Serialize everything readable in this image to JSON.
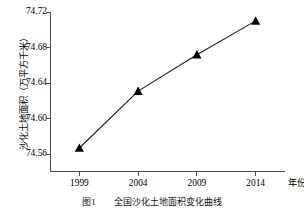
{
  "chart_data": {
    "type": "line",
    "title": "",
    "xlabel": "年份",
    "ylabel": "沙化土地面积（万平方千米）",
    "categories": [
      "1999",
      "2004",
      "2009",
      "2014"
    ],
    "x": [
      1999,
      2004,
      2009,
      2014
    ],
    "values": [
      74.567,
      74.631,
      74.672,
      74.71
    ],
    "series": [
      {
        "name": "沙化土地面积",
        "values": [
          74.567,
          74.631,
          74.672,
          74.71
        ]
      }
    ],
    "ylim": [
      74.54,
      74.72
    ],
    "xlim": [
      1996.5,
      2016.5
    ],
    "yticks": [
      "74.56",
      "74.60",
      "74.64",
      "74.68",
      "74.72"
    ],
    "ytick_values": [
      74.56,
      74.6,
      74.64,
      74.68,
      74.72
    ],
    "xticks": [
      "1999",
      "2004",
      "2009",
      "2014"
    ],
    "grid": false,
    "legend": "none",
    "marker": "triangle",
    "marker_color": "#000000",
    "line_color": "#1a1a1a",
    "axis_color": "#4d4d4d"
  },
  "caption": {
    "text": "图1　　全国沙化土地面积变化曲线"
  },
  "axis": {
    "y_title": "沙化土地面积（万平方千米）",
    "x_title": "年份"
  }
}
